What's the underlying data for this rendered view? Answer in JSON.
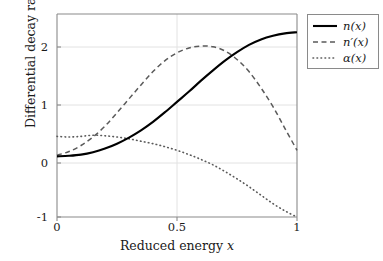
{
  "chart_data": {
    "type": "line",
    "title": "",
    "xlabel": "Reduced energy x",
    "ylabel": "Differential decay rate",
    "xlim": [
      0,
      1
    ],
    "ylim": [
      -1,
      2.35
    ],
    "xticks": [
      "0",
      "0.5",
      "1"
    ],
    "xtick_values": [
      0,
      0.5,
      1
    ],
    "yticks": [
      "-1",
      "0",
      "1",
      "2"
    ],
    "ytick_values": [
      -1,
      0,
      1,
      2
    ],
    "grid": true,
    "legend_position": "outside-top-right",
    "series": [
      {
        "name": "n(x)",
        "style": "solid",
        "color": "#000000",
        "x": [
          0,
          0.05,
          0.1,
          0.15,
          0.2,
          0.25,
          0.3,
          0.35,
          0.4,
          0.45,
          0.5,
          0.55,
          0.6,
          0.65,
          0.7,
          0.75,
          0.8,
          0.85,
          0.9,
          0.95,
          1
        ],
        "values": [
          0.0,
          0.01,
          0.03,
          0.07,
          0.13,
          0.21,
          0.31,
          0.43,
          0.57,
          0.73,
          0.9,
          1.07,
          1.25,
          1.42,
          1.58,
          1.72,
          1.84,
          1.93,
          1.99,
          2.03,
          2.05
        ]
      },
      {
        "name": "n'(x)",
        "style": "dashed",
        "color": "#5a5a5a",
        "x": [
          0,
          0.05,
          0.1,
          0.15,
          0.2,
          0.25,
          0.3,
          0.35,
          0.4,
          0.45,
          0.5,
          0.55,
          0.6,
          0.65,
          0.7,
          0.75,
          0.8,
          0.85,
          0.9,
          0.95,
          1
        ],
        "values": [
          0.02,
          0.08,
          0.18,
          0.32,
          0.5,
          0.72,
          0.95,
          1.18,
          1.4,
          1.58,
          1.71,
          1.79,
          1.82,
          1.81,
          1.74,
          1.6,
          1.4,
          1.13,
          0.82,
          0.46,
          0.1
        ]
      },
      {
        "name": "α(x)",
        "style": "dotted",
        "color": "#5a5a5a",
        "x": [
          0,
          0.05,
          0.1,
          0.15,
          0.2,
          0.25,
          0.3,
          0.35,
          0.4,
          0.45,
          0.5,
          0.55,
          0.6,
          0.65,
          0.7,
          0.75,
          0.8,
          0.85,
          0.9,
          0.95,
          1
        ],
        "values": [
          0.33,
          0.32,
          0.33,
          0.35,
          0.34,
          0.32,
          0.29,
          0.25,
          0.21,
          0.16,
          0.1,
          0.03,
          -0.05,
          -0.14,
          -0.25,
          -0.37,
          -0.5,
          -0.64,
          -0.78,
          -0.9,
          -1.0
        ]
      }
    ]
  },
  "legend": {
    "items": [
      {
        "label": "n(x)",
        "style": "solid"
      },
      {
        "label": "n′(x)",
        "style": "dashed"
      },
      {
        "label": "α(x)",
        "style": "dotted"
      }
    ]
  },
  "axis": {
    "xlabel_prefix": "Reduced energy ",
    "xlabel_var": "x",
    "ylabel": "Differential decay rate"
  }
}
